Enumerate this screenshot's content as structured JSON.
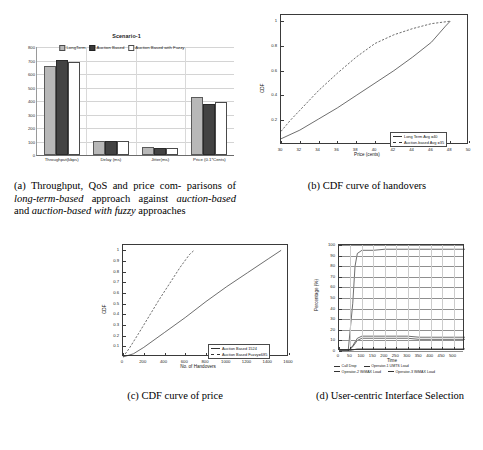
{
  "figure": {
    "subfigures": [
      {
        "key": "a",
        "caption_prefix": "(a)",
        "caption_text": "Throughput, QoS and price comparisons of long-term-based approach against auction-based and auction-based with fuzzy approaches"
      },
      {
        "key": "b",
        "caption_prefix": "(b)",
        "caption_text": "CDF curve of handovers"
      },
      {
        "key": "c",
        "caption_prefix": "(c)",
        "caption_text": "CDF curve of price"
      },
      {
        "key": "d",
        "caption_prefix": "(d)",
        "caption_text": "User-centric Interface Selection"
      }
    ]
  },
  "captions": {
    "a_part1": "(a) Throughput, QoS and price com-",
    "a_part2": "parisons of ",
    "a_em1": "long-term-based",
    "a_part3": " approach",
    "a_part4": "against ",
    "a_em2": "auction-based",
    "a_part5": " and ",
    "a_em3": "auction-based",
    "a_part6": "with fuzzy",
    "a_part7": " approaches",
    "b": "(b) CDF curve of handovers",
    "c": "(c) CDF curve of price",
    "d": "(d) User-centric Interface Selection"
  },
  "chart_data": [
    {
      "id": "a",
      "type": "bar",
      "title": "Scenario-1",
      "xlabel": "",
      "ylabel": "",
      "ylim": [
        0,
        800
      ],
      "yticks": [
        0,
        100,
        200,
        300,
        400,
        500,
        600,
        700,
        800
      ],
      "grid": true,
      "legend_position": "top-center",
      "categories": [
        "Throughput(kbps)",
        "Delay (ms)",
        "Jitter(ms)",
        "Price (0.1*Cents)"
      ],
      "series": [
        {
          "name": "LongTerm",
          "color": "#b8b8b8",
          "values": [
            645,
            88,
            42,
            412
          ]
        },
        {
          "name": "Auction Based",
          "color": "#3a3a3a",
          "values": [
            692,
            88,
            40,
            365
          ]
        },
        {
          "name": "Auction Based with Fuzzy",
          "color": "#ffffff",
          "values": [
            672,
            88,
            40,
            375
          ]
        }
      ]
    },
    {
      "id": "b",
      "type": "line",
      "title": "",
      "xlabel": "Price (cents)",
      "ylabel": "CDF",
      "xlim": [
        30,
        50
      ],
      "ylim": [
        0,
        1.05
      ],
      "xticks": [
        30,
        32,
        34,
        36,
        38,
        40,
        42,
        44,
        46,
        48,
        50
      ],
      "yticks": [
        0.2,
        0.4,
        0.6,
        0.8,
        1
      ],
      "ytick_labels": [
        "0.2",
        "0.4",
        "0.6",
        "0.8",
        "1"
      ],
      "grid": false,
      "legend_position": "bottom-right",
      "series": [
        {
          "name": "Long Term      Avg =40",
          "style": "solid",
          "x": [
            30,
            32,
            34,
            36,
            38,
            40,
            42,
            44,
            46,
            47.5,
            48
          ],
          "y": [
            0.05,
            0.12,
            0.21,
            0.3,
            0.4,
            0.5,
            0.6,
            0.71,
            0.83,
            0.96,
            1.0
          ]
        },
        {
          "name": "Auction-based Avg =35",
          "style": "dashed",
          "x": [
            30,
            31,
            32,
            34,
            36,
            38,
            40,
            42,
            44,
            46,
            48
          ],
          "y": [
            0.11,
            0.2,
            0.28,
            0.44,
            0.58,
            0.71,
            0.82,
            0.89,
            0.94,
            0.98,
            1.0
          ]
        }
      ]
    },
    {
      "id": "c",
      "type": "line",
      "title": "",
      "xlabel": "No. of Handovers",
      "ylabel": "CDF",
      "xlim": [
        0,
        1600
      ],
      "ylim": [
        0,
        1.05
      ],
      "xticks": [
        0,
        200,
        400,
        600,
        800,
        1000,
        1200,
        1400,
        1600
      ],
      "yticks": [
        0.1,
        0.2,
        0.3,
        0.4,
        0.5,
        0.6,
        0.7,
        0.8,
        0.9,
        1
      ],
      "ytick_labels": [
        "0.1",
        "0.2",
        "0.3",
        "0.4",
        "0.5",
        "0.6",
        "0.7",
        "0.8",
        "0.9",
        "1"
      ],
      "grid": false,
      "legend_position": "bottom-right",
      "series": [
        {
          "name": "Auction Based 1524",
          "style": "solid",
          "x": [
            0,
            100,
            200,
            400,
            600,
            800,
            1000,
            1200,
            1400,
            1524
          ],
          "y": [
            0.0,
            0.03,
            0.09,
            0.23,
            0.37,
            0.52,
            0.66,
            0.79,
            0.92,
            1.0
          ]
        },
        {
          "name": "Auction Based Fuzzy=685",
          "style": "dashed",
          "x": [
            0,
            60,
            150,
            250,
            350,
            450,
            550,
            640,
            685
          ],
          "y": [
            0.0,
            0.08,
            0.22,
            0.38,
            0.54,
            0.69,
            0.84,
            0.96,
            1.0
          ]
        }
      ]
    },
    {
      "id": "d",
      "type": "line",
      "title": "",
      "xlabel": "Time",
      "ylabel": "Percentage (%)",
      "xlim": [
        0,
        550
      ],
      "ylim": [
        0,
        100
      ],
      "xticks": [
        0,
        50,
        100,
        150,
        200,
        250,
        300,
        350,
        400,
        450,
        500
      ],
      "yticks": [
        0,
        10,
        20,
        30,
        40,
        50,
        60,
        70,
        80,
        90,
        100
      ],
      "grid": true,
      "legend_position": "below-axes",
      "series": [
        {
          "name": "Call Drop",
          "style": "solid",
          "x": [
            0,
            40,
            60,
            80,
            100,
            150,
            200,
            250,
            300,
            350,
            400,
            450,
            500,
            550
          ],
          "y": [
            0,
            0,
            1,
            2,
            2,
            2,
            2,
            2,
            2,
            2,
            2,
            2,
            2,
            2
          ]
        },
        {
          "name": "Operator-1 UMTS Load",
          "style": "solid",
          "x": [
            0,
            40,
            60,
            70,
            80,
            100,
            150,
            200,
            250,
            300,
            350,
            400,
            450,
            500,
            550
          ],
          "y": [
            0,
            0,
            45,
            80,
            92,
            95,
            95,
            96,
            96,
            96,
            96,
            96,
            96,
            96,
            96
          ]
        },
        {
          "name": "Operator-2 WiMAX Load",
          "style": "solid",
          "x": [
            0,
            40,
            60,
            80,
            100,
            150,
            200,
            250,
            300,
            350,
            400,
            450,
            500,
            550
          ],
          "y": [
            0,
            0,
            5,
            12,
            14,
            14,
            14,
            14,
            14,
            13,
            13,
            13,
            13,
            13
          ]
        },
        {
          "name": "Operator-3 WiMAX Load",
          "style": "solid",
          "x": [
            0,
            40,
            60,
            80,
            100,
            150,
            200,
            250,
            300,
            350,
            400,
            450,
            500,
            550
          ],
          "y": [
            0,
            0,
            4,
            10,
            12,
            12,
            12,
            12,
            12,
            11,
            11,
            11,
            11,
            11
          ]
        }
      ]
    }
  ]
}
